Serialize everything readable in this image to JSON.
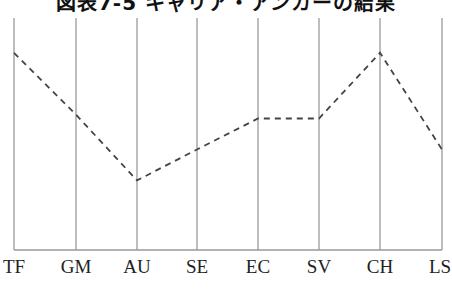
{
  "chart_data": {
    "type": "line",
    "title": "図表7-5 キャリア・アンカーの結果",
    "xlabel": "",
    "ylabel": "",
    "categories": [
      "TF",
      "GM",
      "AU",
      "SE",
      "EC",
      "SV",
      "CH",
      "LS"
    ],
    "series": [
      {
        "name": "score",
        "values": [
          5.1,
          3.5,
          1.8,
          2.6,
          3.4,
          3.4,
          5.1,
          2.6
        ],
        "style": "dashed",
        "color": "#444444"
      }
    ],
    "ylim": [
      0,
      6
    ],
    "grid": {
      "vertical": true,
      "horizontal_baseline": true
    },
    "legend": "none",
    "y_axis_ticks": "none"
  },
  "title": "図表7-5 キャリア・アンカーの結果",
  "x_labels": [
    "TF",
    "GM",
    "AU",
    "SE",
    "EC",
    "SV",
    "CH",
    "LS"
  ],
  "colors": {
    "grid": "#9a9a9a",
    "line": "#444444",
    "text": "#222222"
  }
}
